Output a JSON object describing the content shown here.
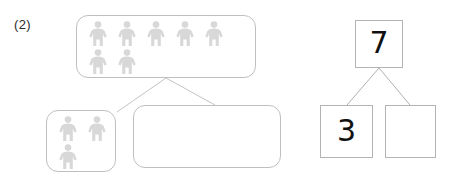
{
  "worksheet": {
    "problem_label": "(2)",
    "background_color": "#ffffff"
  },
  "picture_model": {
    "whole_group": {
      "name": "whole-group-box",
      "icon": "person-icon",
      "icon_color": "#d8d8d8",
      "total_count": 7,
      "rows": [
        {
          "count": 5
        },
        {
          "count": 2
        }
      ]
    },
    "part_left": {
      "name": "part-left-box",
      "icon": "person-icon",
      "icon_color": "#d8d8d8",
      "total_count": 3,
      "rows": [
        {
          "count": 2
        },
        {
          "count": 1
        }
      ]
    },
    "part_right": {
      "name": "part-right-box",
      "icon": "person-icon",
      "icon_color": "#d8d8d8",
      "total_count": 0,
      "rows": []
    },
    "connector_color": "#c0c0c0"
  },
  "number_bond": {
    "whole": {
      "value": "7",
      "filled": true
    },
    "part_a": {
      "value": "3",
      "filled": true
    },
    "part_b": {
      "value": "",
      "filled": false
    },
    "border_color": "#b4b4b4",
    "connector_color": "#b0b0b0"
  }
}
